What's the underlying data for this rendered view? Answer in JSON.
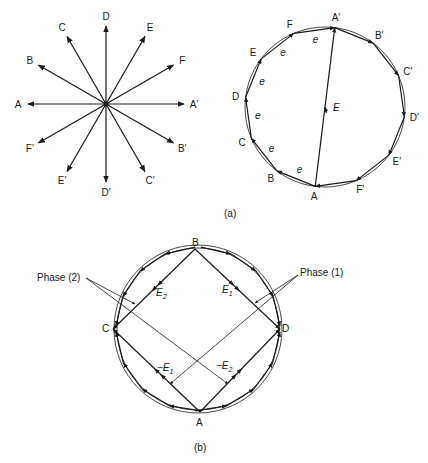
{
  "figure": {
    "part_a": {
      "caption": "(a)",
      "star": {
        "center": [
          106,
          104
        ],
        "radius": 78,
        "labels": [
          {
            "text": "A",
            "angle": 180
          },
          {
            "text": "B",
            "angle": 150
          },
          {
            "text": "C",
            "angle": 120
          },
          {
            "text": "D",
            "angle": 90
          },
          {
            "text": "E",
            "angle": 60
          },
          {
            "text": "F",
            "angle": 30
          },
          {
            "text": "A′",
            "angle": 0
          },
          {
            "text": "B′",
            "angle": -30
          },
          {
            "text": "C′",
            "angle": -60
          },
          {
            "text": "D′",
            "angle": -90
          },
          {
            "text": "E′",
            "angle": -120
          },
          {
            "text": "F′",
            "angle": -150
          }
        ]
      },
      "polygon": {
        "center": [
          325,
          107
        ],
        "radius": 80,
        "vertex_labels": [
          "A",
          "B",
          "C",
          "D",
          "E",
          "F",
          "A′",
          "B′",
          "C′",
          "D′",
          "E′",
          "F′"
        ],
        "segment_label": "e",
        "resultant_label": "E"
      }
    },
    "part_b": {
      "caption": "(b)",
      "center": [
        198,
        329
      ],
      "radius": 84,
      "points": {
        "A": "A",
        "B": "B",
        "C": "C",
        "D": "D"
      },
      "vector_labels": {
        "E1": "E",
        "E1_sub": "1",
        "E2": "E",
        "E2_sub": "2",
        "negE1": "−E",
        "negE1_sub": "1",
        "negE2": "−E",
        "negE2_sub": "2"
      },
      "phase_labels": {
        "phase1": "Phase (1)",
        "phase2": "Phase (2)"
      }
    }
  }
}
